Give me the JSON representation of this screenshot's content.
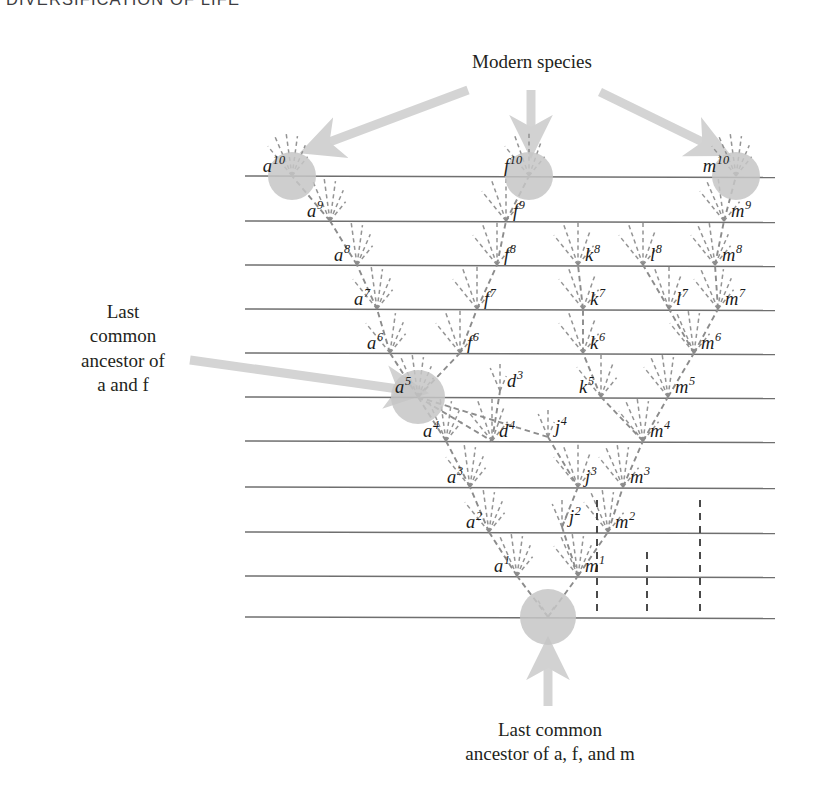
{
  "running_head": "DIVERSIFICATION OF LIFE",
  "callouts": {
    "modern_species": "Modern species",
    "left": "Last\ncommon\nancestor of\na and f",
    "bottom": "Last common\nancestor of a, f, and m"
  },
  "colors": {
    "timeline": "#6f6f6f",
    "branch": "#8c8c8c",
    "highlight_circle": "#c6c6c6",
    "arrow": "#d4d4d4",
    "text": "#231f20"
  },
  "chart_data": {
    "type": "diagram",
    "timelines": [
      {
        "index": 11,
        "y": 176
      },
      {
        "index": 10,
        "y": 221
      },
      {
        "index": 9,
        "y": 265
      },
      {
        "index": 8,
        "y": 309
      },
      {
        "index": 7,
        "y": 353
      },
      {
        "index": 6,
        "y": 397
      },
      {
        "index": 5,
        "y": 441
      },
      {
        "index": 4,
        "y": 487
      },
      {
        "index": 3,
        "y": 532
      },
      {
        "index": 2,
        "y": 576
      },
      {
        "index": 1,
        "y": 617
      }
    ],
    "timeline_x": [
      245,
      775
    ],
    "nodes": [
      {
        "id": "a10",
        "letter": "a",
        "gen": "10",
        "x": 292,
        "y": 176,
        "side": "left",
        "circle": 24
      },
      {
        "id": "f10",
        "letter": "f",
        "gen": "10",
        "x": 529,
        "y": 176,
        "side": "left",
        "circle": 24
      },
      {
        "id": "m10",
        "letter": "m",
        "gen": "10",
        "x": 736,
        "y": 176,
        "side": "left",
        "circle": 24
      },
      {
        "id": "a9",
        "letter": "a",
        "gen": "9",
        "x": 330,
        "y": 221,
        "side": "left"
      },
      {
        "id": "f9",
        "letter": "f",
        "gen": "9",
        "x": 506,
        "y": 221,
        "side": "right"
      },
      {
        "id": "m9",
        "letter": "m",
        "gen": "9",
        "x": 724,
        "y": 221,
        "side": "right"
      },
      {
        "id": "a8",
        "letter": "a",
        "gen": "8",
        "x": 357,
        "y": 265,
        "side": "left"
      },
      {
        "id": "f8",
        "letter": "f",
        "gen": "8",
        "x": 497,
        "y": 265,
        "side": "right"
      },
      {
        "id": "k8",
        "letter": "k",
        "gen": "8",
        "x": 578,
        "y": 265,
        "side": "right"
      },
      {
        "id": "l8",
        "letter": "l",
        "gen": "8",
        "x": 643,
        "y": 265,
        "side": "right"
      },
      {
        "id": "m8",
        "letter": "m",
        "gen": "8",
        "x": 715,
        "y": 265,
        "side": "right"
      },
      {
        "id": "a7",
        "letter": "a",
        "gen": "7",
        "x": 377,
        "y": 309,
        "side": "left"
      },
      {
        "id": "f7",
        "letter": "f",
        "gen": "7",
        "x": 477,
        "y": 309,
        "side": "right"
      },
      {
        "id": "k7",
        "letter": "k",
        "gen": "7",
        "x": 583,
        "y": 309,
        "side": "right"
      },
      {
        "id": "l7",
        "letter": "l",
        "gen": "7",
        "x": 669,
        "y": 309,
        "side": "right"
      },
      {
        "id": "m7",
        "letter": "m",
        "gen": "7",
        "x": 718,
        "y": 309,
        "side": "right"
      },
      {
        "id": "a6",
        "letter": "a",
        "gen": "6",
        "x": 390,
        "y": 353,
        "side": "left"
      },
      {
        "id": "f6",
        "letter": "f",
        "gen": "6",
        "x": 460,
        "y": 353,
        "side": "right"
      },
      {
        "id": "k6",
        "letter": "k",
        "gen": "6",
        "x": 583,
        "y": 353,
        "side": "right"
      },
      {
        "id": "m6",
        "letter": "m",
        "gen": "6",
        "x": 694,
        "y": 353,
        "side": "right"
      },
      {
        "id": "a5",
        "letter": "a",
        "gen": "5",
        "x": 418,
        "y": 397,
        "side": "left",
        "circle": 27
      },
      {
        "id": "d3",
        "letter": "d",
        "gen": "3",
        "x": 500,
        "y": 391,
        "side": "right",
        "label_only": true
      },
      {
        "id": "k5",
        "letter": "k",
        "gen": "5",
        "x": 601,
        "y": 397,
        "side": "left"
      },
      {
        "id": "m5",
        "letter": "m",
        "gen": "5",
        "x": 668,
        "y": 397,
        "side": "right"
      },
      {
        "id": "a4",
        "letter": "a",
        "gen": "4",
        "x": 446,
        "y": 441,
        "side": "left"
      },
      {
        "id": "d4",
        "letter": "d",
        "gen": "4",
        "x": 492,
        "y": 441,
        "side": "right"
      },
      {
        "id": "j4",
        "letter": "j",
        "gen": "4",
        "x": 548,
        "y": 437,
        "side": "right",
        "label_only": true
      },
      {
        "id": "m4",
        "letter": "m",
        "gen": "4",
        "x": 643,
        "y": 441,
        "side": "right"
      },
      {
        "id": "a3",
        "letter": "a",
        "gen": "3",
        "x": 470,
        "y": 487,
        "side": "left"
      },
      {
        "id": "j3",
        "letter": "j",
        "gen": "3",
        "x": 578,
        "y": 487,
        "side": "right"
      },
      {
        "id": "m3",
        "letter": "m",
        "gen": "3",
        "x": 623,
        "y": 487,
        "side": "right"
      },
      {
        "id": "a2",
        "letter": "a",
        "gen": "2",
        "x": 489,
        "y": 532,
        "side": "left"
      },
      {
        "id": "j2",
        "letter": "j",
        "gen": "2",
        "x": 562,
        "y": 527,
        "side": "right",
        "label_only": true
      },
      {
        "id": "m2",
        "letter": "m",
        "gen": "2",
        "x": 608,
        "y": 532,
        "side": "right"
      },
      {
        "id": "a1",
        "letter": "a",
        "gen": "1",
        "x": 517,
        "y": 576,
        "side": "left"
      },
      {
        "id": "m1",
        "letter": "m",
        "gen": "1",
        "x": 578,
        "y": 576,
        "side": "right"
      },
      {
        "id": "root",
        "letter": "",
        "gen": "",
        "x": 548,
        "y": 617,
        "side": "left",
        "circle": 28,
        "label_only": false,
        "unlabeled": true
      }
    ],
    "surviving_lineages": [
      "a",
      "f",
      "m"
    ],
    "arrows": [
      {
        "name": "modern-species-arrow-left",
        "from": [
          468,
          90
        ],
        "to": [
          308,
          150
        ]
      },
      {
        "name": "modern-species-arrow-center",
        "from": [
          531,
          90
        ],
        "to": [
          531,
          150
        ]
      },
      {
        "name": "modern-species-arrow-right",
        "from": [
          600,
          92
        ],
        "to": [
          723,
          152
        ]
      },
      {
        "name": "last-common-ancestor-af-arrow",
        "from": [
          190,
          360
        ],
        "to": [
          420,
          392
        ]
      },
      {
        "name": "last-common-ancestor-afm-arrow",
        "from": [
          548,
          706
        ],
        "to": [
          548,
          645
        ]
      }
    ],
    "persistent_dashed_verticals": [
      {
        "x": 597,
        "y1": 500,
        "y2": 617
      },
      {
        "x": 647,
        "y1": 552,
        "y2": 617
      },
      {
        "x": 700,
        "y1": 500,
        "y2": 617
      }
    ]
  }
}
